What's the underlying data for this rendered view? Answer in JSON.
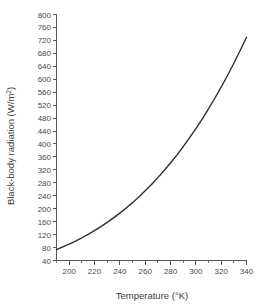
{
  "chart_data": {
    "type": "line",
    "title": "",
    "xlabel": "Temperature (°K)",
    "ylabel": "Black-body radiation (W/m²)",
    "ylabel_main": "Black-body radiation (W/m",
    "ylabel_sup": "2",
    "ylabel_close": ")",
    "xlabel_main": "Temperature (",
    "xlabel_deg": "°",
    "xlabel_close": "K)",
    "xlim": [
      190,
      340
    ],
    "ylim": [
      40,
      800
    ],
    "grid": false,
    "legend": false,
    "x_ticks": [
      200,
      220,
      240,
      260,
      280,
      300,
      320,
      340
    ],
    "x_minor_ticks": [
      190,
      210,
      230,
      250,
      270,
      290,
      310,
      330
    ],
    "x_tick_labels": [
      "200",
      "220",
      "240",
      "260",
      "280",
      "300",
      "320",
      "340"
    ],
    "y_ticks": [
      40,
      80,
      120,
      160,
      200,
      240,
      280,
      320,
      360,
      400,
      440,
      480,
      520,
      560,
      600,
      640,
      680,
      720,
      760,
      800
    ],
    "y_tick_labels": [
      "40",
      "80",
      "120",
      "160",
      "200",
      "240",
      "280",
      "320",
      "360",
      "400",
      "440",
      "480",
      "520",
      "560",
      "600",
      "640",
      "680",
      "720",
      "760",
      "800"
    ],
    "series": [
      {
        "name": "Black-body radiation",
        "color": "#2b2b2b",
        "x": [
          190,
          195,
          200,
          205,
          210,
          215,
          220,
          225,
          230,
          235,
          240,
          245,
          250,
          255,
          260,
          265,
          270,
          275,
          280,
          285,
          290,
          295,
          300,
          305,
          310,
          315,
          320,
          325,
          330,
          335,
          340
        ],
        "values": [
          73.9,
          82.1,
          90.8,
          100.1,
          110.2,
          120.9,
          132.4,
          144.6,
          157.7,
          171.6,
          186.4,
          202.1,
          218.8,
          236.5,
          255.2,
          275.0,
          295.9,
          318.0,
          341.2,
          365.7,
          391.5,
          418.6,
          447.1,
          477.0,
          508.3,
          541.2,
          575.6,
          611.6,
          649.3,
          688.6,
          729.7
        ]
      }
    ],
    "equation_note": "Stefan-Boltzmann: E = sigma*T^4"
  }
}
